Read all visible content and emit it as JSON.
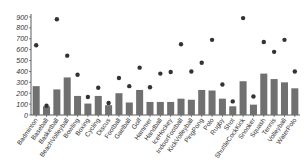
{
  "chart_data": {
    "type": "bar",
    "title": "",
    "xlabel": "",
    "ylabel": "",
    "ylim": [
      0,
      900
    ],
    "yticks": [
      0,
      100,
      200,
      300,
      400,
      500,
      600,
      700,
      800,
      900
    ],
    "categories": [
      "Badminton",
      "Baseball",
      "Basketball",
      "BeachVolleyball",
      "Bowling",
      "Boxing",
      "Cycling",
      "Discus",
      "Football",
      "Gaelball",
      "Golf",
      "Hammer",
      "Handball",
      "IceHockey",
      "IndoorFootball",
      "KickVolleyball",
      "PingPong",
      "Polo",
      "Rugby",
      "Shot",
      "ShuttleCockKick",
      "Snooker",
      "Squash",
      "Tennis",
      "Volleyball",
      "WaterPolo"
    ],
    "series": [
      {
        "name": "bars",
        "type": "bar",
        "color": "#707070",
        "values": [
          265,
          80,
          235,
          345,
          175,
          105,
          175,
          90,
          200,
          115,
          230,
          120,
          120,
          120,
          150,
          140,
          230,
          225,
          150,
          80,
          310,
          95,
          380,
          330,
          300,
          245
        ]
      },
      {
        "name": "dots",
        "type": "scatter",
        "color": "#333333",
        "values": [
          640,
          85,
          880,
          545,
          370,
          165,
          250,
          110,
          340,
          265,
          435,
          255,
          380,
          395,
          650,
          400,
          480,
          690,
          280,
          125,
          890,
          170,
          670,
          580,
          690,
          400
        ]
      }
    ]
  }
}
